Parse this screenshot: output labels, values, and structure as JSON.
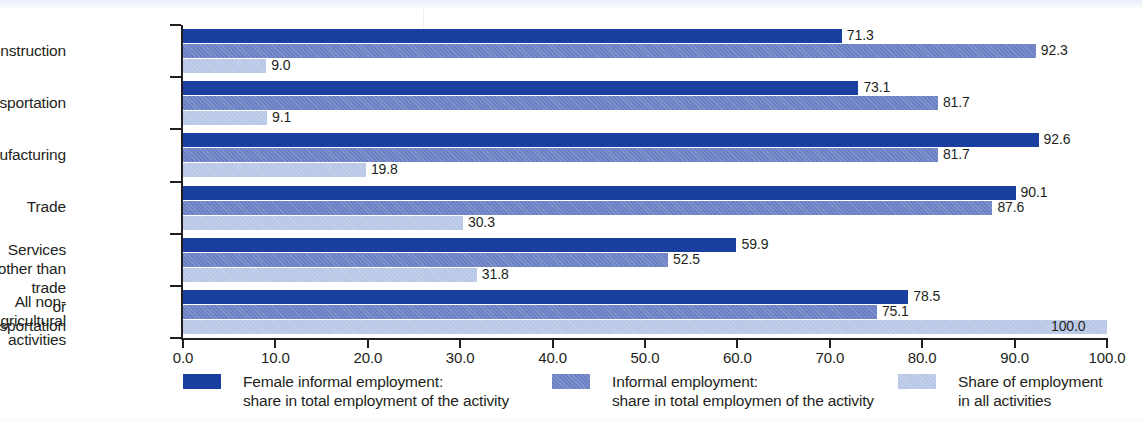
{
  "chart_data": {
    "type": "bar",
    "orientation": "horizontal",
    "grouped": true,
    "title": "",
    "subtitle": "",
    "xlabel": "",
    "ylabel": "",
    "xlim": [
      0.0,
      100.0
    ],
    "xticks": [
      "0.0",
      "10.0",
      "20.0",
      "30.0",
      "40.0",
      "50.0",
      "60.0",
      "70.0",
      "80.0",
      "90.0",
      "100.0"
    ],
    "xtick_values": [
      0,
      10,
      20,
      30,
      40,
      50,
      60,
      70,
      80,
      90,
      100
    ],
    "grid": false,
    "legend_position": "bottom",
    "categories": [
      "Construction",
      "Transportation",
      "Manufacturing",
      "Trade",
      "Services other than trade\nor transportation",
      "All non-agricultural\nactivities"
    ],
    "series": [
      {
        "name": "Female informal employment:\nshare in total employment of the activity",
        "color": "#1b3fa0",
        "values": [
          71.3,
          73.1,
          92.6,
          90.1,
          59.9,
          78.5
        ],
        "labels": [
          "71.3",
          "73.1",
          "92.6",
          "90.1",
          "59.9",
          "78.5"
        ]
      },
      {
        "name": "Informal employment:\nshare in total employmen of the activity",
        "color": "#6b81c4",
        "values": [
          92.3,
          81.7,
          81.7,
          87.6,
          52.5,
          75.1
        ],
        "labels": [
          "92.3",
          "81.7",
          "81.7",
          "87.6",
          "52.5",
          "75.1"
        ]
      },
      {
        "name": "Share of employment\nin all activities",
        "color": "#b9c8e6",
        "values": [
          9.0,
          9.1,
          19.8,
          30.3,
          31.8,
          100.0
        ],
        "labels": [
          "9.0",
          "9.1",
          "19.8",
          "30.3",
          "31.8",
          "100.0"
        ]
      }
    ]
  },
  "legend": {
    "items": [
      {
        "label": "Female informal employment:\nshare in total employment of the activity",
        "color": "#1b3fa0"
      },
      {
        "label": "Informal employment:\nshare in total employmen of the activity",
        "color": "#6b81c4"
      },
      {
        "label": "Share of employment\nin all activities",
        "color": "#b9c8e6"
      }
    ]
  },
  "axis": {
    "line_color": "#231f20"
  }
}
